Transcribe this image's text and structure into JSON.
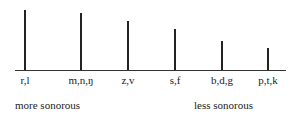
{
  "chart_data": {
    "type": "bar",
    "categories": [
      "r,l",
      "m,n,ŋ",
      "z,v",
      "s,f",
      "b,d,g",
      "p,t,k"
    ],
    "values": [
      6,
      5.5,
      4.5,
      3.8,
      2.8,
      2.2
    ],
    "xlabel": "",
    "ylabel": "",
    "annotations": [
      "more sonorous",
      "less sonorous"
    ],
    "grid": false
  },
  "bars": [
    {
      "label": "r,l",
      "x": 25,
      "top": 10
    },
    {
      "label": "m,n,ŋ",
      "x": 81,
      "top": 13
    },
    {
      "label": "z,v",
      "x": 128,
      "top": 21
    },
    {
      "label": "s,f",
      "x": 175,
      "top": 29
    },
    {
      "label": "b,d,g",
      "x": 222,
      "top": 41
    },
    {
      "label": "p,t,k",
      "x": 268,
      "top": 48
    }
  ],
  "captions": {
    "left": "more sonorous",
    "right": "less sonorous"
  }
}
